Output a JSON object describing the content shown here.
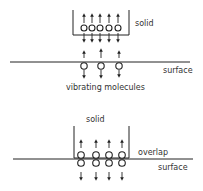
{
  "top_diagram": {
    "solid_label": "solid",
    "surface_label": "surface",
    "caption": "vibrating molecules"
  },
  "bottom_diagram": {
    "solid_label": "solid",
    "overlap_label": "overlap",
    "surface_label": "surface"
  },
  "colors": {
    "stroke": "#222222",
    "text": "#333333"
  }
}
